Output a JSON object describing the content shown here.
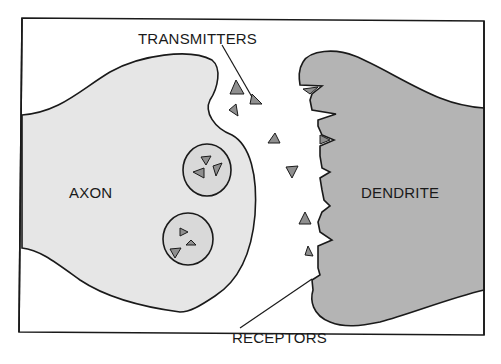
{
  "diagram": {
    "labels": {
      "transmitters": "TRANSMITTERS",
      "axon": "AXON",
      "dendrite": "DENDRITE",
      "receptors": "RECEPTORS"
    },
    "colors": {
      "background": "#ffffff",
      "frame": "#1a1a1a",
      "axon_fill": "#e6e6e6",
      "dendrite_fill": "#b4b4b4",
      "vesicle_fill": "#d9d9d9",
      "transmitter_fill": "#8f8f8f",
      "outline": "#1a1a1a"
    },
    "components": [
      {
        "id": "axon",
        "label": "AXON",
        "description": "presynaptic terminal, light gray"
      },
      {
        "id": "dendrite",
        "label": "DENDRITE",
        "description": "postsynaptic membrane with receptor notches, darker gray"
      },
      {
        "id": "vesicles",
        "count": 2,
        "transmitters_per_vesicle": 3
      },
      {
        "id": "free-transmitters",
        "count": 7
      },
      {
        "id": "receptors",
        "count": 6
      }
    ]
  }
}
